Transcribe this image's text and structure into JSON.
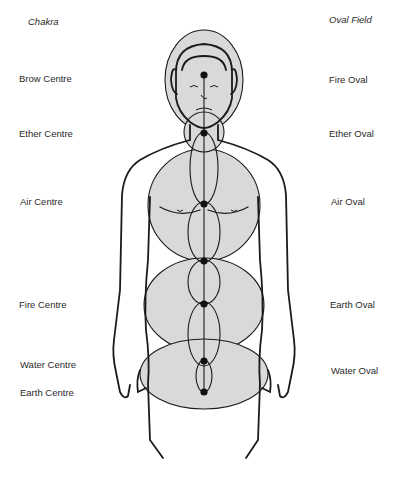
{
  "headers": {
    "left": "Chakra",
    "right": "Oval Field"
  },
  "chakras": [
    {
      "label": "Brow Centre",
      "y": 78
    },
    {
      "label": "Ether Centre",
      "y": 134
    },
    {
      "label": "Air Centre",
      "y": 201
    },
    {
      "label": "Fire Centre",
      "y": 305
    },
    {
      "label": "Water Centre",
      "y": 364
    },
    {
      "label": "Earth Centre",
      "y": 392
    }
  ],
  "ovals": [
    {
      "label": "Fire Oval",
      "y": 80
    },
    {
      "label": "Ether Oval",
      "y": 134
    },
    {
      "label": "Air Oval",
      "y": 201
    },
    {
      "label": "Earth Oval",
      "y": 304
    },
    {
      "label": "Water Oval",
      "y": 371
    }
  ],
  "colors": {
    "fill": "#d9d9d9",
    "line": "#1a1a1a"
  }
}
